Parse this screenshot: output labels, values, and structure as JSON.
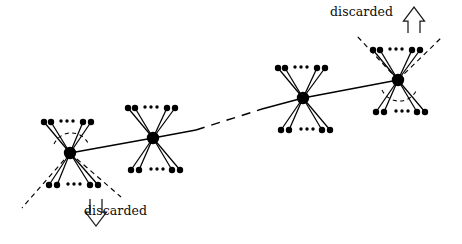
{
  "figure": {
    "kind": "node-link-diagram",
    "background_color": "#ffffff",
    "ink_color": "#000000",
    "labels": {
      "discarded_bottom": "discarded",
      "discarded_top": "discarded"
    },
    "ellipsis_glyph": "...",
    "hubs": [
      {
        "id": "hub-1",
        "x": 70,
        "y": 153
      },
      {
        "id": "hub-2",
        "x": 153,
        "y": 138
      },
      {
        "id": "hub-3",
        "x": 303,
        "y": 98
      },
      {
        "id": "hub-4",
        "x": 398,
        "y": 80
      }
    ],
    "hub_radius": 6.2,
    "leaf_radius": 3.2,
    "clusters": [
      {
        "id": "cluster-1",
        "hub": "hub-1",
        "top_fan": {
          "cy": 122,
          "dx": [
            -26,
            -19,
            13,
            21
          ],
          "ellipsis_x": 68,
          "ellipsis_y": 121
        },
        "bottom_fan": {
          "cy": 185,
          "dx": [
            -21,
            -13,
            20,
            28
          ],
          "ellipsis_x": 75,
          "ellipsis_y": 184
        },
        "cone": {
          "direction": "down",
          "present": true,
          "arc": "above-hub"
        }
      },
      {
        "id": "cluster-2",
        "hub": "hub-2",
        "top_fan": {
          "cy": 108,
          "dx": [
            -25,
            -18,
            14,
            22
          ],
          "ellipsis_x": 151,
          "ellipsis_y": 107
        },
        "bottom_fan": {
          "cy": 170,
          "dx": [
            -22,
            -14,
            19,
            27
          ],
          "ellipsis_x": 158,
          "ellipsis_y": 169
        },
        "cone": {
          "direction": "none",
          "present": false,
          "arc": "none"
        }
      },
      {
        "id": "cluster-3",
        "hub": "hub-3",
        "top_fan": {
          "cy": 68,
          "dx": [
            -25,
            -18,
            14,
            22
          ],
          "ellipsis_x": 301,
          "ellipsis_y": 67
        },
        "bottom_fan": {
          "cy": 130,
          "dx": [
            -22,
            -14,
            19,
            27
          ],
          "ellipsis_x": 308,
          "ellipsis_y": 129
        },
        "cone": {
          "direction": "none",
          "present": false,
          "arc": "none"
        }
      },
      {
        "id": "cluster-4",
        "hub": "hub-4",
        "top_fan": {
          "cy": 50,
          "dx": [
            -25,
            -18,
            14,
            22
          ],
          "ellipsis_x": 396,
          "ellipsis_y": 49
        },
        "bottom_fan": {
          "cy": 112,
          "dx": [
            -22,
            -14,
            19,
            27
          ],
          "ellipsis_x": 403,
          "ellipsis_y": 111
        },
        "cone": {
          "direction": "up",
          "present": true,
          "arc": "below-hub"
        }
      }
    ],
    "backbone": [
      {
        "from": "hub-1",
        "to": "hub-2",
        "style": "solid"
      },
      {
        "from": "hub-2",
        "to": "hub-3",
        "style": "solid-dashed-solid"
      },
      {
        "from": "hub-3",
        "to": "hub-4",
        "style": "solid"
      }
    ],
    "arrows": [
      {
        "id": "arrow-down",
        "direction": "down",
        "x": 96,
        "y": 205,
        "style": "hollow-outline"
      },
      {
        "id": "arrow-up",
        "direction": "up",
        "x": 414,
        "y": 20,
        "style": "hollow-outline"
      }
    ]
  }
}
